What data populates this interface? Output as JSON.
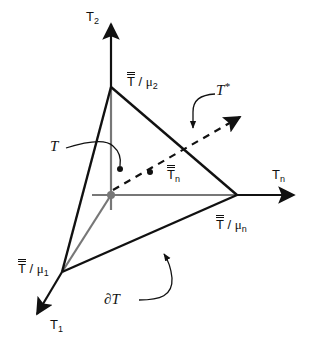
{
  "diagram": {
    "type": "3D simplex / axis diagram",
    "colors": {
      "stroke": "#111111",
      "axis_inner": "#777777",
      "origin_dot": "#777777"
    },
    "axes": [
      {
        "id": "T2",
        "label": "T",
        "subscript": "2",
        "direction": "up"
      },
      {
        "id": "Tn",
        "label": "T",
        "subscript": "n",
        "direction": "right"
      },
      {
        "id": "T1",
        "label": "T",
        "subscript": "1",
        "direction": "down-left"
      }
    ],
    "vertices": [
      {
        "id": "v2",
        "label_main": "T",
        "label_sep": " / ",
        "label_mu": "μ",
        "subscript": "2"
      },
      {
        "id": "vn",
        "label_main": "T",
        "label_sep": " / ",
        "label_mu": "μ",
        "subscript": "n"
      },
      {
        "id": "v1",
        "label_main": "T",
        "label_sep": " / ",
        "label_mu": "μ",
        "subscript": "1"
      }
    ],
    "annotations": {
      "set": {
        "symbol": "T"
      },
      "set_star": {
        "symbol": "T",
        "superscript": "*"
      },
      "boundary": {
        "prefix": "∂",
        "symbol": "T"
      },
      "point": {
        "label": "T",
        "subscript": "n"
      }
    }
  }
}
